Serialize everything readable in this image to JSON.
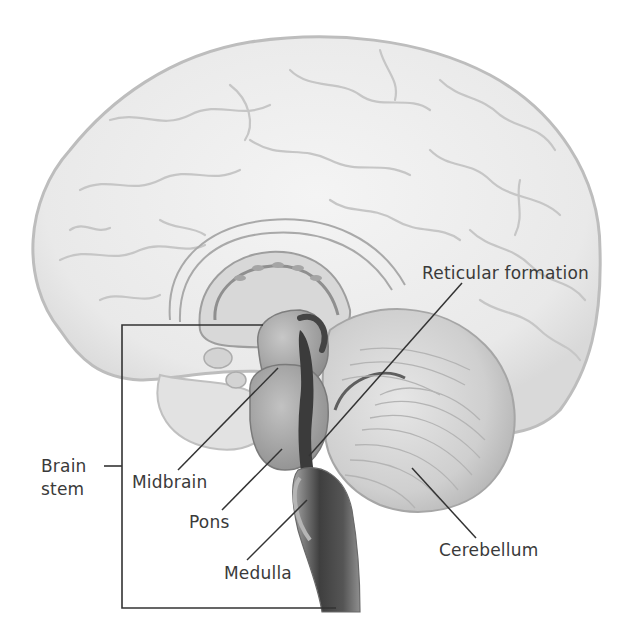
{
  "figure": {
    "colors": {
      "background": "#ffffff",
      "cerebrum_fill": "#ebebeb",
      "cerebrum_stroke": "#b9b9b9",
      "brainstem_dark": "#4a4a4a",
      "brainstem_mid": "#8c8c8c",
      "cerebellum_fill": "#d6d6d6",
      "leader_line": "#333333",
      "label_text": "#3a3a3a"
    }
  },
  "labels": {
    "reticular_formation": "Reticular formation",
    "brain_stem_line1": "Brain",
    "brain_stem_line2": "stem",
    "midbrain": "Midbrain",
    "pons": "Pons",
    "medulla": "Medulla",
    "cerebellum": "Cerebellum"
  },
  "bracket": {
    "label": "Brain stem",
    "top_y": 325,
    "bottom_y": 608,
    "x": 122
  }
}
